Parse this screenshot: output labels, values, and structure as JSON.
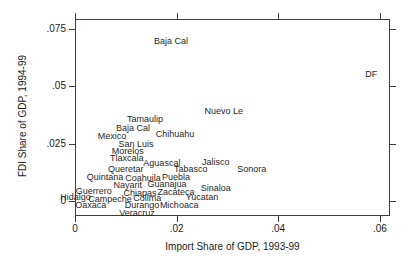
{
  "figure": {
    "background": "#ffffff",
    "border_color": "#3d3d3d",
    "text_color": "#1a1a1a"
  },
  "chart_data": {
    "type": "scatter",
    "title": "",
    "xlabel": "Import Share of GDP, 1993-99",
    "ylabel": "FDI Share of GDP, 1994-99",
    "xlim": [
      0,
      0.062
    ],
    "ylim": [
      -0.0065,
      0.0794
    ],
    "grid": false,
    "legend": false,
    "marker_style": "text-label-only",
    "x_ticks": [
      {
        "value": 0,
        "label": "0"
      },
      {
        "value": 0.02,
        "label": ".02"
      },
      {
        "value": 0.04,
        "label": ".04"
      },
      {
        "value": 0.06,
        "label": ".06"
      }
    ],
    "y_ticks": [
      {
        "value": 0,
        "label": "0"
      },
      {
        "value": 0.025,
        "label": ".025"
      },
      {
        "value": 0.05,
        "label": ".05"
      },
      {
        "value": 0.075,
        "label": ".075"
      }
    ],
    "points": [
      {
        "label": "Baja Cal",
        "x": 0.0189,
        "y": 0.0698
      },
      {
        "label": "DF",
        "x": 0.0583,
        "y": 0.0554
      },
      {
        "label": "Nuevo Le",
        "x": 0.0293,
        "y": 0.0392
      },
      {
        "label": "Tamaulip",
        "x": 0.0138,
        "y": 0.0358
      },
      {
        "label": "Baja Cal",
        "x": 0.0114,
        "y": 0.0318
      },
      {
        "label": "Chihuahu",
        "x": 0.0197,
        "y": 0.0292
      },
      {
        "label": "Mexico",
        "x": 0.0073,
        "y": 0.0283
      },
      {
        "label": "San Luis",
        "x": 0.012,
        "y": 0.0249
      },
      {
        "label": "Morelos",
        "x": 0.0104,
        "y": 0.0218
      },
      {
        "label": "Tlaxcala",
        "x": 0.0102,
        "y": 0.0188
      },
      {
        "label": "Aguascal",
        "x": 0.0171,
        "y": 0.0166
      },
      {
        "label": "Jalisco",
        "x": 0.0277,
        "y": 0.017
      },
      {
        "label": "Queretar",
        "x": 0.01,
        "y": 0.014
      },
      {
        "label": "Tabasco",
        "x": 0.0228,
        "y": 0.014
      },
      {
        "label": "Sonora",
        "x": 0.0348,
        "y": 0.014
      },
      {
        "label": "Quintana",
        "x": 0.0059,
        "y": 0.0105
      },
      {
        "label": "Coahuila",
        "x": 0.0134,
        "y": 0.01
      },
      {
        "label": "Puebla",
        "x": 0.0199,
        "y": 0.0105
      },
      {
        "label": "Nayarit",
        "x": 0.0104,
        "y": 0.007
      },
      {
        "label": "Guanajua",
        "x": 0.0181,
        "y": 0.0074
      },
      {
        "label": "Guerrero",
        "x": 0.0037,
        "y": 0.0044
      },
      {
        "label": "Chiapas",
        "x": 0.0128,
        "y": 0.0035
      },
      {
        "label": "Zacateca",
        "x": 0.0199,
        "y": 0.0039
      },
      {
        "label": "Sinaloa",
        "x": 0.0277,
        "y": 0.0055
      },
      {
        "label": "Hidalgo",
        "x": 0.0001,
        "y": 0.0017
      },
      {
        "label": "Campeche",
        "x": 0.0069,
        "y": 0.0009
      },
      {
        "label": "Colima",
        "x": 0.0142,
        "y": 0.0013
      },
      {
        "label": "Yucatan",
        "x": 0.025,
        "y": 0.0017
      },
      {
        "label": "Oaxaca",
        "x": 0.0031,
        "y": -0.0017
      },
      {
        "label": "Durango",
        "x": 0.0132,
        "y": -0.0017
      },
      {
        "label": "Michoaca",
        "x": 0.0205,
        "y": -0.0017
      },
      {
        "label": "Veracruz",
        "x": 0.0122,
        "y": -0.0052
      }
    ]
  }
}
